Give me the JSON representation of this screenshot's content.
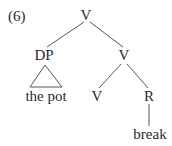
{
  "example_number": "(6)",
  "tree": {
    "root": {
      "label": "V"
    },
    "dp": {
      "label": "DP",
      "terminal": "the pot",
      "triangle": true
    },
    "v_bar": {
      "label": "V"
    },
    "v_head": {
      "label": "V"
    },
    "r": {
      "label": "R",
      "terminal": "break"
    }
  },
  "colors": {
    "text": "#2a2a2a",
    "line": "#555555",
    "background": "#ffffff"
  }
}
